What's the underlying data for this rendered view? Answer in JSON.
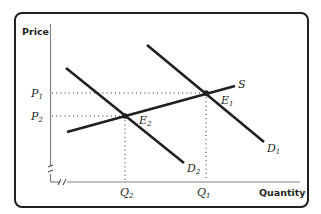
{
  "diagram": {
    "type": "supply-demand",
    "axes": {
      "y_label": "Price",
      "x_label": "Quantity"
    },
    "curves": {
      "supply": {
        "label": "S",
        "from": [
          67,
          132
        ],
        "to": [
          235,
          86
        ]
      },
      "demand_1": {
        "label": "D",
        "sub": "1",
        "from": [
          147,
          45
        ],
        "to": [
          264,
          142
        ]
      },
      "demand_2": {
        "label": "D",
        "sub": "2",
        "from": [
          66,
          68
        ],
        "to": [
          184,
          163
        ]
      }
    },
    "equilibria": {
      "e1": {
        "label": "E",
        "sub": "1",
        "point": [
          206,
          93
        ]
      },
      "e2": {
        "label": "E",
        "sub": "2",
        "point": [
          125,
          116
        ]
      }
    },
    "price_ticks": [
      {
        "label": "P",
        "sub": "1",
        "y": 93
      },
      {
        "label": "P",
        "sub": "2",
        "y": 116
      }
    ],
    "quantity_ticks": [
      {
        "label": "Q",
        "sub": "2",
        "x": 125
      },
      {
        "label": "Q",
        "sub": "1",
        "x": 206
      }
    ],
    "colors": {
      "line": "#231f20",
      "axis": "#808080",
      "frame": "#231f20"
    }
  }
}
